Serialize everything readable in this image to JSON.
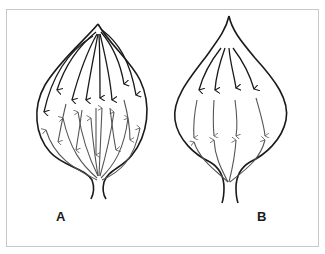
{
  "figure": {
    "panels": [
      {
        "id": "A",
        "label": "A",
        "description": "Leaf with many dense downward-pointing arrows (veins) converging from apex toward base"
      },
      {
        "id": "B",
        "label": "B",
        "description": "Leaf with four arrows pointing down from apex and four arrows pointing up from base, meeting in the middle"
      }
    ],
    "colors": {
      "ink": "#1a1a1a",
      "light_ink": "#555555",
      "frame": "#c8c8c8",
      "background": "#ffffff"
    }
  }
}
